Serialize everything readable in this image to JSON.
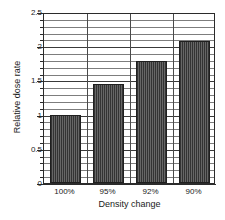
{
  "chart_data": {
    "type": "bar",
    "title": "",
    "xlabel": "Density change",
    "ylabel": "Relative dose rate",
    "categories": [
      "100%",
      "95%",
      "92%",
      "90%"
    ],
    "values": [
      1.0,
      1.45,
      1.78,
      2.07
    ],
    "ylim": [
      0,
      2.5
    ],
    "ytick_labels": [
      "0",
      "0.5",
      "1",
      "1.5",
      "2",
      "2.5"
    ],
    "ytick_values": [
      0,
      0.5,
      1,
      1.5,
      2,
      2.5
    ],
    "minor_tick_step": 0.1,
    "grid": "horizontal-minor-and-major, vertical category separators",
    "legend": "none",
    "bar_color": "#4d4d4d",
    "bar_pattern": "vertical-hatch",
    "axis_color": "#2b2b2b",
    "gridline_color": "#7d7d7d"
  },
  "figure": {
    "caption": ""
  }
}
